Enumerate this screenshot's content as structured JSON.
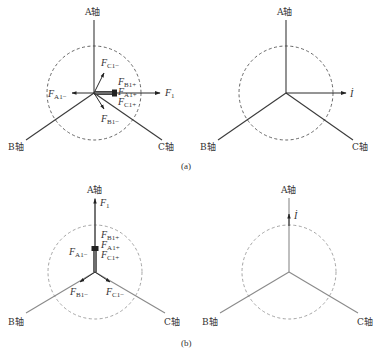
{
  "figure": {
    "captions": {
      "a": "(a)",
      "b": "(b)"
    },
    "axes": {
      "A": "A轴",
      "B": "B轴",
      "C": "C轴"
    },
    "panel_a_left": {
      "labels": {
        "F1": "F",
        "F1_sub": "1",
        "FA1minus": "F",
        "FA1minus_sub": "A1−",
        "FB1plus": "F",
        "FB1plus_sub": "B1+",
        "FA1plus": "F",
        "FA1plus_sub": "A1+",
        "FC1plus": "F",
        "FC1plus_sub": "C1+",
        "FC1minus": "F",
        "FC1minus_sub": "C1−",
        "FB1minus": "F",
        "FB1minus_sub": "B1−"
      }
    },
    "panel_a_right": {
      "current_label": "İ"
    },
    "panel_b_left": {
      "labels": {
        "F1": "F",
        "F1_sub": "1",
        "FB1plus": "F",
        "FB1plus_sub": "B1+",
        "FA1plus": "F",
        "FA1plus_sub": "A1+",
        "FC1plus": "F",
        "FC1plus_sub": "C1+",
        "FA1minus": "F",
        "FA1minus_sub": "A1−",
        "FB1minus": "F",
        "FB1minus_sub": "B1−",
        "FC1minus": "F",
        "FC1minus_sub": "C1−"
      }
    },
    "panel_b_right": {
      "current_label": "İ"
    }
  }
}
